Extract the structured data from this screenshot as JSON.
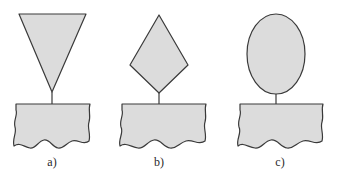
{
  "figure": {
    "panels": [
      {
        "label": "a)",
        "tip_shape": "inverted-triangle"
      },
      {
        "label": "b)",
        "tip_shape": "diamond"
      },
      {
        "label": "c)",
        "tip_shape": "ellipse"
      }
    ],
    "colors": {
      "fill": "#dcdcdc",
      "stroke": "#3a3a3a",
      "background": "#ffffff"
    }
  }
}
